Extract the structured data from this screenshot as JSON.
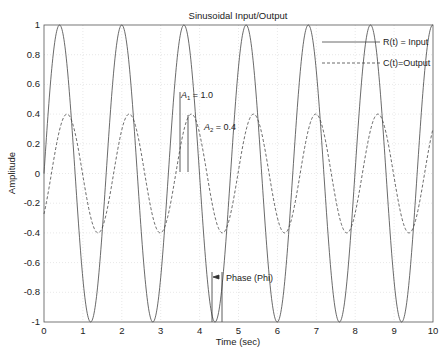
{
  "chart_data": {
    "type": "line",
    "title": "Sinusoidal Input/Output",
    "xlabel": "Time (sec)",
    "ylabel": "Amplitude",
    "xlim": [
      0,
      10
    ],
    "ylim": [
      -1,
      1
    ],
    "xticks": [
      "0",
      "1",
      "2",
      "3",
      "4",
      "5",
      "6",
      "7",
      "8",
      "9",
      "10"
    ],
    "yticks": [
      "1",
      "0.8",
      "0.6",
      "0.4",
      "0.2",
      "0",
      "-0.2",
      "-0.4",
      "-0.6",
      "-0.8",
      "-1"
    ],
    "grid": true,
    "legend_position": "upper right",
    "series": [
      {
        "name": "R(t)=Input",
        "style": "solid",
        "amplitude": 1.0,
        "omega": 3.93,
        "phase": 0,
        "description": "sin(wt)",
        "peaks_at": [
          0.4,
          2.0,
          3.6,
          5.2,
          6.8,
          8.4,
          10.0
        ]
      },
      {
        "name": "C(t)=Output",
        "style": "dashed",
        "amplitude": 0.4,
        "omega": 3.93,
        "phase": -0.75,
        "description": "0.4*sin(wt - phi)",
        "peaks_at": [
          0.6,
          2.2,
          3.8,
          5.4,
          7.0,
          8.6
        ]
      }
    ],
    "annotations": [
      {
        "text": "A1 = 1.0",
        "x": 3.75,
        "y": 0.55
      },
      {
        "text": "A2 = 0.4",
        "x": 4.1,
        "y": 0.3
      },
      {
        "text": "Phase (Phi)",
        "x": 4.6,
        "y": -0.47
      }
    ]
  },
  "labels": {
    "title": "Sinusoidal Input/Output",
    "xlabel": "Time (sec)",
    "ylabel": "Amplitude",
    "legend_input": "R(t) = Input",
    "legend_output": "C(t)=Output",
    "a1": "A",
    "a1_sub": "1",
    "a1_val": " = 1.0",
    "a2": "A",
    "a2_sub": "2",
    "a2_val": " = 0.4",
    "phase": "Phase (Phi)"
  }
}
